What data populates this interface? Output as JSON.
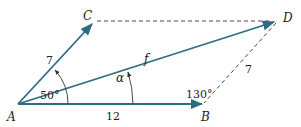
{
  "diagram": {
    "type": "vector-parallelogram",
    "points": {
      "A": "A",
      "B": "B",
      "C": "C",
      "D": "D"
    },
    "vectors": [
      {
        "from": "A",
        "to": "B",
        "magnitude_label": "12"
      },
      {
        "from": "A",
        "to": "C",
        "magnitude_label": "7"
      },
      {
        "from": "A",
        "to": "D",
        "magnitude_label": "f"
      }
    ],
    "dashed_sides": [
      {
        "from": "C",
        "to": "D"
      },
      {
        "from": "B",
        "to": "D",
        "magnitude_label": "7"
      }
    ],
    "angles": {
      "CAB": "50°",
      "DAB": "α",
      "ABD": "130°"
    },
    "colors": {
      "vector": "#2e6b85",
      "dashed": "#333333",
      "text": "#222222"
    }
  }
}
